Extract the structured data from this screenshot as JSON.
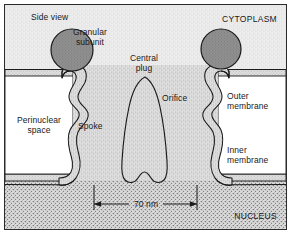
{
  "figure": {
    "labels": {
      "side_view": "Side view",
      "granular_subunit": "Granular\nsubunit",
      "cytoplasm": "CYTOPLASM",
      "central_plug": "Central\nplug",
      "orifice": "Orifice",
      "outer_membrane": "Outer\nmembrane",
      "inner_membrane": "Inner\nmembrane",
      "perinuclear_space": "Perinuclear\nspace",
      "spoke": "Spoke",
      "nucleus": "NUCLEUS",
      "dimension": "70 nm"
    },
    "colors": {
      "outline": "#1a1a1a",
      "granular_subunit_fill": "#8f8f8f",
      "structure_fill": "#d8d8d8",
      "cytoplasm_fill": "#ebebeb",
      "nucleus_fill": "#d2d2d2",
      "perinuclear_fill": "#ffffff",
      "text": "#1a1a1a"
    },
    "measurements": {
      "pore_width_label": "70 nm",
      "pore_width_value": 70,
      "unit": "nm"
    }
  }
}
